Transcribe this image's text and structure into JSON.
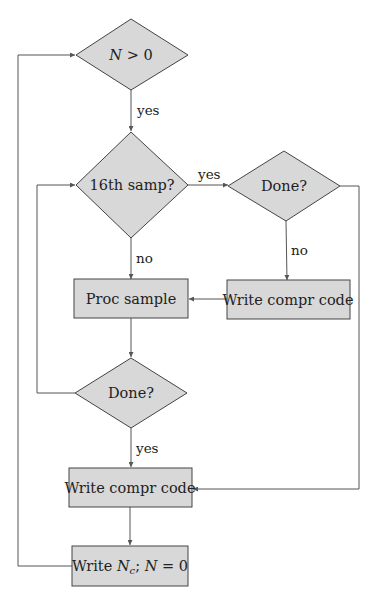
{
  "diagram": {
    "type": "flowchart",
    "nodes": [
      {
        "id": "n_gt_0",
        "shape": "diamond",
        "label_main": "N",
        "label_rest": " > 0"
      },
      {
        "id": "sixteenth",
        "shape": "diamond",
        "label": "16th samp?"
      },
      {
        "id": "done_right",
        "shape": "diamond",
        "label": "Done?"
      },
      {
        "id": "proc_sample",
        "shape": "box",
        "label": "Proc sample"
      },
      {
        "id": "write_code_right",
        "shape": "box",
        "label": "Write compr code"
      },
      {
        "id": "done_center",
        "shape": "diamond",
        "label": "Done?"
      },
      {
        "id": "write_code_bottom",
        "shape": "box",
        "label": "Write compr code"
      },
      {
        "id": "write_nc",
        "shape": "box",
        "label_prefix": "Write ",
        "label_var": "N",
        "label_sub": "c",
        "label_suffix": "; ",
        "label_var2": "N",
        "label_end": " = 0"
      }
    ],
    "edges": [
      {
        "from": "n_gt_0",
        "to": "sixteenth",
        "label": "yes"
      },
      {
        "from": "sixteenth",
        "to": "done_right",
        "label": "yes"
      },
      {
        "from": "sixteenth",
        "to": "proc_sample",
        "label": "no"
      },
      {
        "from": "done_right",
        "to": "write_code_right",
        "label": "no"
      },
      {
        "from": "write_code_right",
        "to": "proc_sample",
        "label": ""
      },
      {
        "from": "proc_sample",
        "to": "done_center",
        "label": ""
      },
      {
        "from": "done_center",
        "to": "sixteenth",
        "label": ""
      },
      {
        "from": "done_center",
        "to": "write_code_bottom",
        "label": "yes"
      },
      {
        "from": "done_right",
        "to": "write_code_bottom",
        "label": ""
      },
      {
        "from": "write_code_bottom",
        "to": "write_nc",
        "label": ""
      },
      {
        "from": "write_nc",
        "to": "n_gt_0",
        "label": ""
      }
    ]
  },
  "colors": {
    "node_fill": "#d8d8d8",
    "stroke": "#444444"
  }
}
